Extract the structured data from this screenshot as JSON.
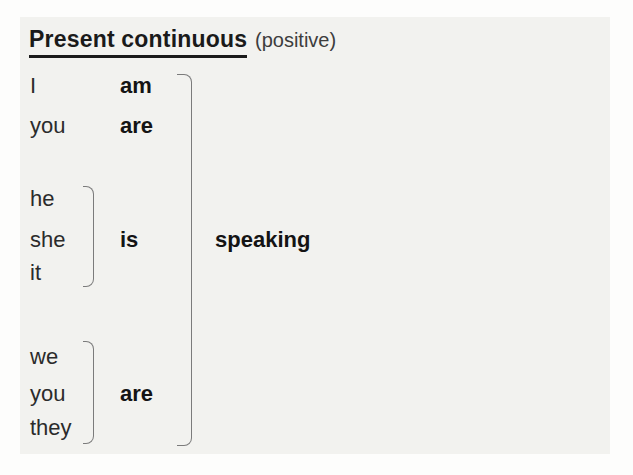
{
  "title": {
    "main": "Present continuous",
    "qualifier": "(positive)"
  },
  "conjugation": {
    "tense": "Present continuous",
    "polarity": "positive",
    "group1": {
      "rows": [
        {
          "pronoun": "I",
          "verb": "am"
        },
        {
          "pronoun": "you",
          "verb": "are"
        }
      ]
    },
    "group2": {
      "pronouns": [
        "he",
        "she",
        "it"
      ],
      "verb": "is"
    },
    "group3": {
      "pronouns": [
        "we",
        "you",
        "they"
      ],
      "verb": "are"
    },
    "participle": "speaking"
  },
  "colors": {
    "page_background": "#fdfdfc",
    "panel_background": "#f2f2ef",
    "title_text": "#1a1a1a",
    "pronoun_text": "#2b2b2b",
    "verb_text": "#141414",
    "qualifier_text": "#3d3d3d",
    "bracket_line": "#7b7b7b"
  }
}
